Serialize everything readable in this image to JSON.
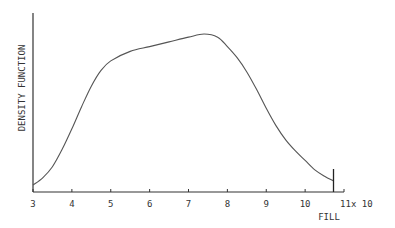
{
  "chart_data": {
    "type": "line",
    "title": "",
    "xlabel": "FILL",
    "xlabel_multiplier": "x 10",
    "ylabel": "DENSITY FUNCTION",
    "xlim": [
      3,
      11
    ],
    "ylim": [
      0,
      1.15
    ],
    "y_units": "relative (normalized to peak = 1.0; y-axis unlabeled)",
    "grid": false,
    "legend": "none",
    "x_ticks": [
      3,
      4,
      5,
      6,
      7,
      8,
      9,
      10,
      11
    ],
    "x_tick_labels": [
      "3",
      "4",
      "5",
      "6",
      "7",
      "8",
      "9",
      "10",
      "11"
    ],
    "series": [
      {
        "name": "density",
        "x": [
          3.0,
          3.25,
          3.5,
          3.75,
          4.0,
          4.25,
          4.5,
          4.75,
          5.0,
          5.5,
          6.0,
          6.5,
          7.0,
          7.4,
          7.75,
          8.0,
          8.25,
          8.5,
          8.75,
          9.0,
          9.25,
          9.5,
          9.75,
          10.0,
          10.25,
          10.5,
          10.73
        ],
        "y": [
          0.044,
          0.09,
          0.16,
          0.27,
          0.4,
          0.54,
          0.67,
          0.77,
          0.83,
          0.89,
          0.92,
          0.95,
          0.98,
          1.0,
          0.98,
          0.92,
          0.85,
          0.76,
          0.65,
          0.53,
          0.42,
          0.33,
          0.26,
          0.2,
          0.14,
          0.1,
          0.07
        ]
      }
    ],
    "annotations": [
      {
        "type": "vertical-marker",
        "x": 10.73,
        "label": ""
      }
    ]
  }
}
